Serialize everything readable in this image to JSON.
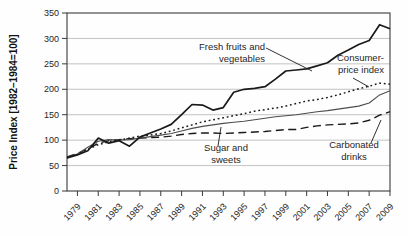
{
  "chart_data": {
    "type": "line",
    "title": "",
    "xlabel": "",
    "ylabel": "Price Index [1982–1984=100]",
    "xlim": [
      1978,
      2009
    ],
    "ylim": [
      0,
      350
    ],
    "grid": "horizontal",
    "legend_position": "inline-annotations",
    "x": [
      1978,
      1979,
      1980,
      1981,
      1982,
      1983,
      1984,
      1985,
      1986,
      1987,
      1988,
      1989,
      1990,
      1991,
      1992,
      1993,
      1994,
      1995,
      1996,
      1997,
      1998,
      1999,
      2000,
      2001,
      2002,
      2003,
      2004,
      2005,
      2006,
      2007,
      2008,
      2009
    ],
    "x_tick_labels": [
      "1979",
      "1981",
      "1983",
      "1985",
      "1987",
      "1989",
      "1991",
      "1993",
      "1995",
      "1997",
      "1999",
      "2001",
      "2003",
      "2005",
      "2007",
      "2009"
    ],
    "x_tick_years": [
      1979,
      1981,
      1983,
      1985,
      1987,
      1989,
      1991,
      1993,
      1995,
      1997,
      1999,
      2001,
      2003,
      2005,
      2007,
      2009
    ],
    "y_ticks": [
      0,
      50,
      100,
      150,
      200,
      250,
      300,
      350
    ],
    "series": [
      {
        "name": "Fresh fruits and vegetables",
        "line_style": "solid-thick",
        "values": [
          65,
          71,
          79,
          104,
          94,
          99,
          88,
          106,
          114,
          122,
          131,
          150,
          170,
          169,
          159,
          164,
          194,
          200,
          202,
          205,
          220,
          236,
          238,
          240,
          246,
          252,
          267,
          277,
          288,
          296,
          327,
          319
        ]
      },
      {
        "name": "Consumer-price index",
        "line_style": "dotted",
        "values": [
          65,
          72,
          82,
          91,
          97,
          100,
          104,
          108,
          110,
          113,
          118,
          124,
          130,
          136,
          140,
          144,
          148,
          152,
          157,
          160,
          163,
          167,
          172,
          177,
          180,
          184,
          189,
          195,
          201,
          206,
          212,
          210
        ]
      },
      {
        "name": "Sugar and sweets",
        "line_style": "solid-thin",
        "values": [
          66,
          73,
          86,
          98,
          101,
          100,
          101,
          104,
          107,
          110,
          113,
          118,
          123,
          127,
          130,
          133,
          135,
          137,
          140,
          143,
          146,
          148,
          150,
          153,
          156,
          158,
          161,
          164,
          167,
          173,
          189,
          197
        ]
      },
      {
        "name": "Carbonated drinks",
        "line_style": "dashed",
        "values": [
          67,
          74,
          83,
          94,
          99,
          101,
          103,
          104,
          105,
          106,
          108,
          111,
          113,
          114,
          114,
          113,
          114,
          115,
          116,
          117,
          119,
          121,
          121,
          125,
          128,
          130,
          131,
          132,
          134,
          139,
          149,
          156
        ]
      }
    ],
    "annotations": [
      {
        "label": "Fresh fruits and\nvegetables",
        "series": "Fresh fruits and vegetables",
        "pointer": [
          [
            266,
            48
          ],
          [
            312,
            71
          ]
        ]
      },
      {
        "label": "Consumer-\nprice index",
        "series": "Consumer-price index",
        "pointer": [
          [
            353,
            78
          ],
          [
            369,
            87
          ]
        ]
      },
      {
        "label": "Sugar and\nsweets",
        "series": "Sugar and sweets",
        "pointer": [
          [
            218,
            146
          ],
          [
            221,
            127
          ]
        ]
      },
      {
        "label": "Carbonated\ndrinks",
        "series": "Carbonated drinks",
        "pointer": [
          [
            371,
            143
          ],
          [
            381,
            120
          ]
        ]
      }
    ]
  },
  "colors": {
    "line": "#1a1a1a",
    "thin_line": "#4d4d4d",
    "grid": "#bcbcbc",
    "frame": "#3a3a3a",
    "text": "#262626",
    "background": "#fefefe"
  }
}
